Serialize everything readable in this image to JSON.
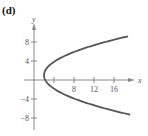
{
  "panel_label": "(d)",
  "chart_data": {
    "type": "line",
    "title": "",
    "xlabel": "x",
    "ylabel": "y",
    "equation": "x = (y - 1)^2 / 4 + 2",
    "xlim": [
      -2,
      19
    ],
    "ylim": [
      -11,
      13
    ],
    "x_ticks": [
      4,
      8,
      12,
      16
    ],
    "x_tick_labels": [
      "8",
      "12",
      "16"
    ],
    "y_ticks": [
      8,
      4,
      -4,
      -8
    ],
    "y_tick_labels": [
      "8",
      "4",
      "-4",
      "-8"
    ],
    "series": [
      {
        "name": "parabola",
        "color": "#555555",
        "points": [
          [
            18.8,
            9.2
          ],
          [
            14.25,
            8
          ],
          [
            9.56,
            6.5
          ],
          [
            6,
            5
          ],
          [
            3,
            3
          ],
          [
            2.25,
            2
          ],
          [
            2,
            1
          ],
          [
            2.25,
            0
          ],
          [
            3,
            -1
          ],
          [
            4.25,
            -2
          ],
          [
            6,
            -3
          ],
          [
            10.25,
            -5
          ],
          [
            14.25,
            -6
          ],
          [
            18.25,
            -7.2
          ]
        ]
      }
    ],
    "grid": false,
    "legend": null
  },
  "colors": {
    "axis": "#888888",
    "curve": "#555555",
    "text": "#555555"
  }
}
